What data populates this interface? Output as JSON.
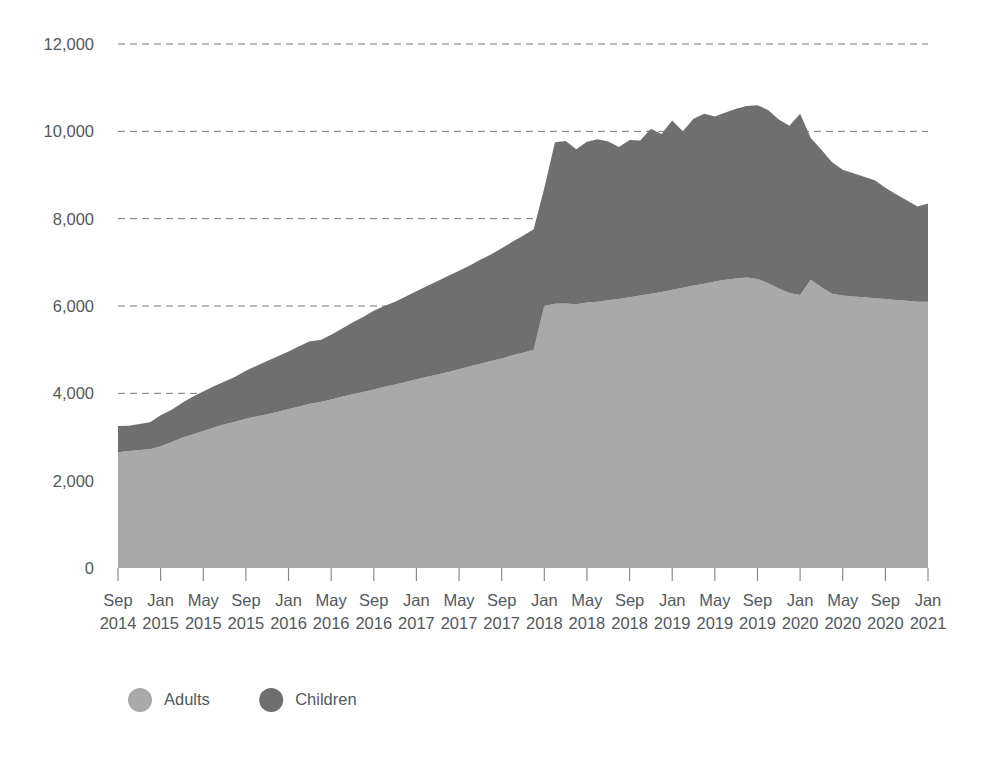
{
  "chart_data": {
    "type": "area",
    "stacked": true,
    "title": "",
    "subtitle": "",
    "xlabel": "",
    "ylabel": "",
    "ylim": [
      0,
      12000
    ],
    "ytick_labels": [
      "0",
      "2,000",
      "4,000",
      "6,000",
      "8,000",
      "10,000",
      "12,000"
    ],
    "ytick_values": [
      0,
      2000,
      4000,
      6000,
      8000,
      10000,
      12000
    ],
    "grid": true,
    "grid_axis": "y",
    "legend_position": "bottom-left",
    "legend": [
      "Adults",
      "Children"
    ],
    "colors": {
      "adults": "#a9a9a9",
      "children": "#6f6f6f",
      "gridline": "#777777",
      "text": "#54585c",
      "background": "#ffffff"
    },
    "xtick_labels": [
      {
        "month": "Sep",
        "year": "2014"
      },
      {
        "month": "Jan",
        "year": "2015"
      },
      {
        "month": "May",
        "year": "2015"
      },
      {
        "month": "Sep",
        "year": "2015"
      },
      {
        "month": "Jan",
        "year": "2016"
      },
      {
        "month": "May",
        "year": "2016"
      },
      {
        "month": "Sep",
        "year": "2016"
      },
      {
        "month": "Jan",
        "year": "2017"
      },
      {
        "month": "May",
        "year": "2017"
      },
      {
        "month": "Sep",
        "year": "2017"
      },
      {
        "month": "Jan",
        "year": "2018"
      },
      {
        "month": "May",
        "year": "2018"
      },
      {
        "month": "Sep",
        "year": "2018"
      },
      {
        "month": "Jan",
        "year": "2019"
      },
      {
        "month": "May",
        "year": "2019"
      },
      {
        "month": "Sep",
        "year": "2019"
      },
      {
        "month": "Jan",
        "year": "2020"
      },
      {
        "month": "May",
        "year": "2020"
      },
      {
        "month": "Sep",
        "year": "2020"
      },
      {
        "month": "Jan",
        "year": "2021"
      }
    ],
    "x": [
      "Sep 2014",
      "Oct 2014",
      "Nov 2014",
      "Dec 2014",
      "Jan 2015",
      "Feb 2015",
      "Mar 2015",
      "Apr 2015",
      "May 2015",
      "Jun 2015",
      "Jul 2015",
      "Aug 2015",
      "Sep 2015",
      "Oct 2015",
      "Nov 2015",
      "Dec 2015",
      "Jan 2016",
      "Feb 2016",
      "Mar 2016",
      "Apr 2016",
      "May 2016",
      "Jun 2016",
      "Jul 2016",
      "Aug 2016",
      "Sep 2016",
      "Oct 2016",
      "Nov 2016",
      "Dec 2016",
      "Jan 2017",
      "Feb 2017",
      "Mar 2017",
      "Apr 2017",
      "May 2017",
      "Jun 2017",
      "Jul 2017",
      "Aug 2017",
      "Sep 2017",
      "Oct 2017",
      "Nov 2017",
      "Dec 2017",
      "Jan 2018",
      "Feb 2018",
      "Mar 2018",
      "Apr 2018",
      "May 2018",
      "Jun 2018",
      "Jul 2018",
      "Aug 2018",
      "Sep 2018",
      "Oct 2018",
      "Nov 2018",
      "Dec 2018",
      "Jan 2019",
      "Feb 2019",
      "Mar 2019",
      "Apr 2019",
      "May 2019",
      "Jun 2019",
      "Jul 2019",
      "Aug 2019",
      "Sep 2019",
      "Oct 2019",
      "Nov 2019",
      "Dec 2019",
      "Jan 2020",
      "Feb 2020",
      "Mar 2020",
      "Apr 2020",
      "May 2020",
      "Jun 2020",
      "Jul 2020",
      "Aug 2020",
      "Sep 2020",
      "Oct 2020",
      "Nov 2020",
      "Dec 2020",
      "Jan 2021"
    ],
    "series": [
      {
        "name": "Adults",
        "color": "#a9a9a9",
        "values": [
          2650,
          2680,
          2700,
          2720,
          2790,
          2880,
          2980,
          3060,
          3140,
          3220,
          3290,
          3350,
          3420,
          3470,
          3520,
          3580,
          3640,
          3700,
          3760,
          3800,
          3860,
          3920,
          3980,
          4030,
          4090,
          4150,
          4200,
          4260,
          4320,
          4380,
          4430,
          4490,
          4550,
          4620,
          4680,
          4740,
          4800,
          4870,
          4930,
          5000,
          6000,
          6050,
          6060,
          6040,
          6080,
          6100,
          6130,
          6160,
          6200,
          6240,
          6280,
          6320,
          6370,
          6420,
          6470,
          6510,
          6560,
          6600,
          6630,
          6650,
          6620,
          6520,
          6400,
          6300,
          6250,
          6600,
          6430,
          6280,
          6240,
          6220,
          6200,
          6180,
          6160,
          6140,
          6120,
          6100,
          6100
        ]
      },
      {
        "name": "Children",
        "color": "#6f6f6f",
        "values": [
          600,
          580,
          600,
          620,
          710,
          740,
          800,
          860,
          900,
          940,
          980,
          1030,
          1100,
          1160,
          1220,
          1270,
          1320,
          1380,
          1430,
          1420,
          1480,
          1560,
          1640,
          1720,
          1800,
          1850,
          1900,
          1960,
          2020,
          2080,
          2140,
          2200,
          2260,
          2310,
          2380,
          2440,
          2520,
          2600,
          2680,
          2760,
          2700,
          3700,
          3720,
          3550,
          3680,
          3720,
          3640,
          3480,
          3600,
          3550,
          3780,
          3620,
          3880,
          3580,
          3820,
          3890,
          3780,
          3830,
          3890,
          3930,
          3980,
          3970,
          3870,
          3830,
          4150,
          3250,
          3150,
          3010,
          2880,
          2820,
          2760,
          2700,
          2550,
          2420,
          2300,
          2180,
          2250
        ]
      }
    ],
    "totals_note": "Stacked totals range from about 3,250 in Sep 2014 to a peak near 10,600 in Sep-Oct 2019, ending near 8,350 in Jan 2021."
  },
  "legend": {
    "items": [
      {
        "label": "Adults",
        "color": "#a9a9a9"
      },
      {
        "label": "Children",
        "color": "#6f6f6f"
      }
    ]
  }
}
